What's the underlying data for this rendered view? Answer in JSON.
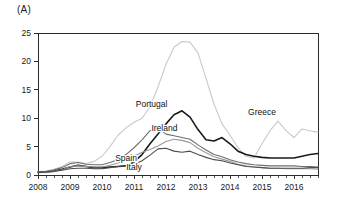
{
  "panel": {
    "label": "(A)"
  },
  "chart_data": {
    "type": "line",
    "title": "",
    "xlabel": "",
    "ylabel": "",
    "xlim": [
      2008.0,
      2016.75
    ],
    "ylim": [
      0,
      25
    ],
    "yticks": [
      0,
      5,
      10,
      15,
      20,
      25
    ],
    "xticks": [
      2008,
      2009,
      2010,
      2011,
      2012,
      2013,
      2014,
      2015,
      2016
    ],
    "xtick_labels": [
      "2008",
      "2009",
      "2010",
      "2011",
      "2012",
      "2013",
      "2014",
      "2015",
      "2016"
    ],
    "minor_tick_interval": 0.25,
    "grid": false,
    "legend_position": "inline-annotations",
    "x": [
      2008.0,
      2008.25,
      2008.5,
      2008.75,
      2009.0,
      2009.25,
      2009.5,
      2009.75,
      2010.0,
      2010.25,
      2010.5,
      2010.75,
      2011.0,
      2011.25,
      2011.5,
      2011.75,
      2012.0,
      2012.25,
      2012.5,
      2012.75,
      2013.0,
      2013.25,
      2013.5,
      2013.75,
      2014.0,
      2014.25,
      2014.5,
      2014.75,
      2015.0,
      2015.25,
      2015.5,
      2015.75,
      2016.0,
      2016.25,
      2016.5,
      2016.75
    ],
    "series": [
      {
        "name": "Greece",
        "color": "#c9c9c9",
        "width": 1.1,
        "label": "Greece",
        "label_x": 2015.0,
        "label_y": 10.6,
        "values": [
          0.6,
          0.7,
          1.0,
          1.5,
          2.3,
          2.3,
          2.0,
          2.4,
          3.3,
          5.0,
          7.0,
          8.3,
          9.3,
          10.0,
          12.0,
          15.5,
          19.5,
          22.5,
          23.5,
          23.4,
          21.5,
          17.0,
          12.5,
          9.0,
          7.0,
          4.8,
          3.3,
          3.0,
          5.5,
          7.8,
          9.5,
          7.8,
          6.6,
          8.1,
          7.8,
          7.5
        ]
      },
      {
        "name": "Portugal",
        "color": "#1a1a1a",
        "width": 1.6,
        "label": "Portugal",
        "label_x": 2011.55,
        "label_y": 12.0,
        "values": [
          0.5,
          0.55,
          0.7,
          1.0,
          1.4,
          1.7,
          1.5,
          1.3,
          1.3,
          1.4,
          1.5,
          1.6,
          2.3,
          3.6,
          5.5,
          7.2,
          9.0,
          10.6,
          11.3,
          10.2,
          8.0,
          6.2,
          6.0,
          6.6,
          5.5,
          4.2,
          3.6,
          3.3,
          3.1,
          3.0,
          3.0,
          3.0,
          3.0,
          3.3,
          3.6,
          3.8
        ]
      },
      {
        "name": "Ireland",
        "color": "#6e6e6e",
        "width": 1.1,
        "label": "Ireland",
        "label_x": 2011.95,
        "label_y": 7.7,
        "values": [
          0.55,
          0.6,
          0.9,
          1.3,
          2.0,
          2.2,
          1.9,
          1.8,
          1.8,
          2.2,
          2.7,
          3.6,
          4.8,
          6.2,
          7.8,
          8.2,
          7.2,
          6.9,
          6.6,
          6.3,
          5.3,
          4.4,
          3.6,
          3.2,
          2.7,
          2.3,
          2.0,
          1.8,
          1.7,
          1.6,
          1.6,
          1.6,
          1.6,
          1.5,
          1.5,
          1.4
        ]
      },
      {
        "name": "Spain",
        "color": "#9a9a9a",
        "width": 1.1,
        "label": "Spain",
        "label_x": 2010.75,
        "label_y": 2.5,
        "values": [
          0.4,
          0.45,
          0.6,
          0.9,
          1.5,
          1.6,
          1.5,
          1.4,
          1.4,
          1.7,
          2.1,
          2.6,
          3.3,
          4.0,
          4.5,
          5.1,
          5.9,
          6.3,
          6.1,
          5.7,
          4.7,
          3.9,
          3.2,
          2.8,
          2.4,
          1.9,
          1.6,
          1.4,
          1.3,
          1.2,
          1.2,
          1.1,
          1.1,
          1.1,
          1.1,
          1.0
        ]
      },
      {
        "name": "Italy",
        "color": "#4d4d4d",
        "width": 1.1,
        "label": "Italy",
        "label_x": 2011.0,
        "label_y": 0.9,
        "values": [
          0.45,
          0.5,
          0.65,
          0.85,
          1.1,
          1.2,
          1.2,
          1.1,
          1.1,
          1.3,
          1.5,
          1.6,
          1.8,
          2.5,
          3.5,
          4.6,
          4.7,
          4.2,
          4.0,
          4.2,
          3.6,
          3.1,
          2.7,
          2.5,
          2.1,
          1.8,
          1.5,
          1.4,
          1.3,
          1.2,
          1.2,
          1.2,
          1.2,
          1.2,
          1.3,
          1.3
        ]
      }
    ]
  }
}
